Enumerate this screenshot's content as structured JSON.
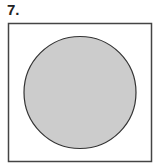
{
  "problem": {
    "number_label": "7."
  },
  "figure": {
    "frame": {
      "x": 8.5,
      "y": 23.5,
      "width": 143,
      "height": 138,
      "stroke": "#444444"
    },
    "circle": {
      "cx": 80,
      "cy": 92.5,
      "r": 56,
      "fill": "#cccccc",
      "stroke": "#333333"
    }
  }
}
